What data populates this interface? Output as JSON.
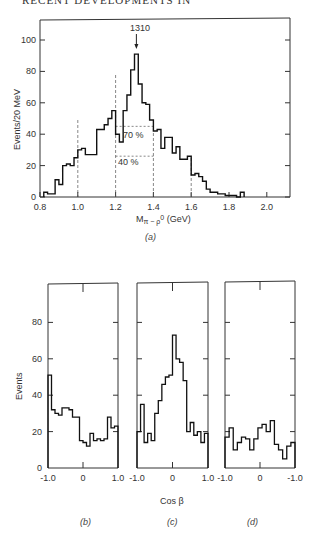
{
  "header": {
    "text": "RECENT DEVELOPMENTS IN"
  },
  "chart_data": [
    {
      "type": "bar",
      "panel": "(a)",
      "title": "",
      "xlabel": "M π⁻ρ⁰ (GeV)",
      "ylabel": "Events/20 MeV",
      "xlim": [
        0.8,
        2.2
      ],
      "ylim": [
        0,
        110
      ],
      "x_ticks": [
        "0.8",
        "1.0",
        "1.2",
        "1.4",
        "1.6",
        "1.8",
        "2.0"
      ],
      "y_ticks": [
        "0",
        "20",
        "40",
        "60",
        "80",
        "100"
      ],
      "bin_width_gev": 0.02,
      "bin_edges_start": 0.82,
      "values": [
        3,
        2,
        2,
        11,
        8,
        20,
        21,
        20,
        25,
        30,
        31,
        27,
        27,
        27,
        43,
        43,
        46,
        50,
        55,
        40,
        35,
        55,
        65,
        81,
        91,
        72,
        60,
        59,
        49,
        42,
        43,
        31,
        38,
        38,
        28,
        32,
        24,
        24,
        26,
        14,
        15,
        13,
        10,
        5,
        3,
        3,
        2,
        2,
        1,
        1,
        1,
        0,
        3
      ],
      "annotations": [
        {
          "text": "1310",
          "x": 1.31,
          "type": "arrow"
        },
        {
          "text": "70 %",
          "range": [
            1.2,
            1.4
          ],
          "y": 45
        },
        {
          "text": "40 %",
          "range": [
            1.2,
            1.4
          ],
          "y": 26
        }
      ],
      "dashed_lines_x": [
        1.0,
        1.2,
        1.4,
        1.6
      ],
      "grid": false
    },
    {
      "type": "bar",
      "panel": "(b)",
      "xlabel": "",
      "ylabel": "Events",
      "xlim": [
        -1.0,
        1.0
      ],
      "ylim": [
        0,
        110
      ],
      "x_ticks": [
        "-1.0",
        "0",
        "1.0"
      ],
      "y_ticks": [
        "0",
        "20",
        "40",
        "60",
        "80"
      ],
      "values": [
        51,
        32,
        30,
        29,
        33,
        33,
        32,
        28,
        28,
        15,
        14,
        12,
        19,
        15,
        16,
        15,
        16,
        28,
        22,
        23
      ]
    },
    {
      "type": "bar",
      "panel": "(c)",
      "xlabel": "Cos β",
      "xlim": [
        -1.0,
        1.0
      ],
      "ylim": [
        0,
        110
      ],
      "x_ticks": [
        "-1.0",
        "0",
        "1.0"
      ],
      "values": [
        20,
        35,
        14,
        19,
        15,
        30,
        37,
        46,
        50,
        51,
        73,
        60,
        58,
        48,
        20,
        25,
        18,
        20,
        14,
        19
      ]
    },
    {
      "type": "bar",
      "panel": "(d)",
      "xlabel": "",
      "xlim": [
        -1.0,
        1.0
      ],
      "ylim": [
        0,
        110
      ],
      "x_ticks": [
        "-1.0",
        "0",
        "-1.0"
      ],
      "values": [
        17,
        22,
        10,
        14,
        17,
        16,
        10,
        16,
        22,
        24,
        20,
        26,
        13,
        10,
        5,
        12,
        14
      ]
    }
  ],
  "labels": {
    "peak": "1310",
    "pct70": "70 %",
    "pct40": "40 %",
    "xlabel_a": "M π − ρ0  (GeV)",
    "ylabel_a": "Events/20 MeV",
    "panel_a": "(a)",
    "ylabel_lower": "Events",
    "xlabel_lower": "Cos β",
    "panel_b": "(b)",
    "panel_c": "(c)",
    "panel_d": "(d)"
  }
}
